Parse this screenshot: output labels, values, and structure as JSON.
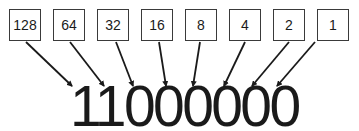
{
  "place_values": [
    "128",
    "64",
    "32",
    "16",
    "8",
    "4",
    "2",
    "1"
  ],
  "binary_number": "11000000",
  "colors": {
    "stroke": "#1a1a1a",
    "box_border": "#3a3a3a",
    "background": "#ffffff"
  }
}
